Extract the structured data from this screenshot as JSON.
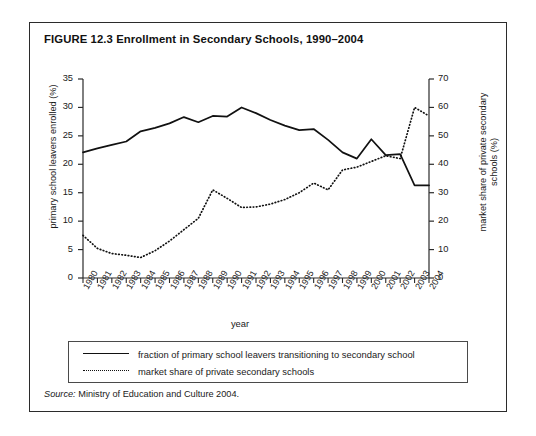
{
  "figure": {
    "title": "FIGURE 12.3  Enrollment in Secondary Schools, 1990–2004",
    "source_label": "Source:",
    "source_text": " Ministry of Education and Culture 2004."
  },
  "legend": {
    "items": [
      {
        "label": "fraction of primary school leavers transitioning to secondary school",
        "style": "solid"
      },
      {
        "label": "market share of private secondary schools",
        "style": "dotted"
      }
    ]
  },
  "chart_data": {
    "type": "line",
    "title": "FIGURE 12.3  Enrollment in Secondary Schools, 1990–2004",
    "xlabel": "year",
    "ylabel": "primary school leavers enrolled (%)",
    "y2label": "market share of private secondary schools (%)",
    "grid": false,
    "legend_position": "bottom",
    "x": [
      1980,
      1981,
      1982,
      1983,
      1984,
      1985,
      1986,
      1987,
      1988,
      1989,
      1990,
      1991,
      1992,
      1993,
      1994,
      1995,
      1996,
      1997,
      1998,
      1999,
      2000,
      2001,
      2002,
      2003,
      2004
    ],
    "xtick_labels": [
      "1980",
      "1981",
      "1982",
      "1983",
      "1984",
      "1985",
      "1986",
      "1987",
      "1988",
      "1989",
      "1990",
      "1991",
      "1992",
      "1993",
      "1994",
      "1995",
      "1996",
      "1997",
      "1998",
      "1999",
      "2000",
      "2001",
      "2002",
      "2003",
      "2004"
    ],
    "ylim": [
      0,
      35
    ],
    "ytick_labels": [
      "0",
      "5",
      "10",
      "15",
      "20",
      "25",
      "30",
      "35"
    ],
    "yticks": [
      0,
      5,
      10,
      15,
      20,
      25,
      30,
      35
    ],
    "y2lim": [
      0,
      70
    ],
    "y2tick_labels": [
      "0",
      "10",
      "20",
      "30",
      "40",
      "50",
      "60",
      "70"
    ],
    "y2ticks": [
      0,
      10,
      20,
      30,
      40,
      50,
      60,
      70
    ],
    "series": [
      {
        "name": "fraction of primary school leavers transitioning to secondary school",
        "axis": "left",
        "style": "solid",
        "color": "#111111",
        "values": [
          22.1,
          22.8,
          23.4,
          24.0,
          25.8,
          26.4,
          27.2,
          28.3,
          27.4,
          28.5,
          28.4,
          30.0,
          29.0,
          27.8,
          26.8,
          26.0,
          26.2,
          24.3,
          22.1,
          21.0,
          24.4,
          21.6,
          21.8,
          16.3,
          16.3
        ]
      },
      {
        "name": "market share of private secondary schools",
        "axis": "right",
        "style": "dotted",
        "color": "#111111",
        "values": [
          15.0,
          10.4,
          8.6,
          8.0,
          7.2,
          9.6,
          13.0,
          17.0,
          21.0,
          31.0,
          28.0,
          24.8,
          25.0,
          26.0,
          27.6,
          30.0,
          33.4,
          31.0,
          38.0,
          39.0,
          41.0,
          43.0,
          42.0,
          60.0,
          57.0
        ]
      }
    ]
  }
}
